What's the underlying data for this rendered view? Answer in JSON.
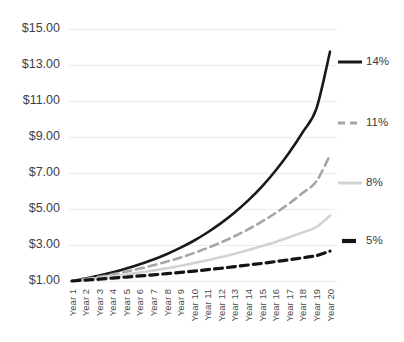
{
  "chart_data": {
    "type": "line",
    "title": "",
    "subtitle": "",
    "xlabel": "",
    "ylabel": "",
    "grid": true,
    "legend_position": "right-inline-end-of-line",
    "x": [
      "Year 1",
      "Year 2",
      "Year 3",
      "Year 4",
      "Year 5",
      "Year 6",
      "Year 7",
      "Year 8",
      "Year 9",
      "Year 10",
      "Year 11",
      "Year 12",
      "Year 13",
      "Year 14",
      "Year 15",
      "Year 16",
      "Year 17",
      "Year 18",
      "Year 19",
      "Year 20"
    ],
    "categories": [
      "Year 1",
      "Year 2",
      "Year 3",
      "Year 4",
      "Year 5",
      "Year 6",
      "Year 7",
      "Year 8",
      "Year 9",
      "Year 10",
      "Year 11",
      "Year 12",
      "Year 13",
      "Year 14",
      "Year 15",
      "Year 16",
      "Year 17",
      "Year 18",
      "Year 19",
      "Year 20"
    ],
    "ylim": [
      1.0,
      15.0
    ],
    "ytick_values": [
      1.0,
      3.0,
      5.0,
      7.0,
      9.0,
      11.0,
      13.0,
      15.0
    ],
    "ytick_labels": [
      "$1.00",
      "$3.00",
      "$5.00",
      "$7.00",
      "$9.00",
      "$11.00",
      "$13.00",
      "$15.00"
    ],
    "series": [
      {
        "name": "14%",
        "label": "14%",
        "color": "#1a1a1a",
        "style": "solid",
        "values": [
          1.0,
          1.14,
          1.3,
          1.48,
          1.69,
          1.93,
          2.19,
          2.5,
          2.85,
          3.25,
          3.71,
          4.23,
          4.82,
          5.49,
          6.26,
          7.14,
          8.14,
          9.28,
          10.58,
          13.74
        ]
      },
      {
        "name": "11%",
        "label": "11%",
        "color": "#a6a6a6",
        "style": "dashed",
        "values": [
          1.0,
          1.11,
          1.23,
          1.37,
          1.52,
          1.69,
          1.87,
          2.08,
          2.3,
          2.56,
          2.84,
          3.15,
          3.5,
          3.88,
          4.31,
          4.78,
          5.31,
          5.9,
          6.54,
          8.0
        ]
      },
      {
        "name": "8%",
        "label": "8%",
        "color": "#d2d2d2",
        "style": "solid",
        "values": [
          1.0,
          1.08,
          1.17,
          1.26,
          1.36,
          1.47,
          1.59,
          1.71,
          1.85,
          2.0,
          2.16,
          2.33,
          2.52,
          2.72,
          2.94,
          3.17,
          3.43,
          3.7,
          4.0,
          4.63
        ]
      },
      {
        "name": "5%",
        "label": "5%",
        "color": "#141414",
        "style": "dashed-thick",
        "values": [
          1.0,
          1.05,
          1.1,
          1.16,
          1.22,
          1.28,
          1.34,
          1.41,
          1.48,
          1.55,
          1.63,
          1.71,
          1.8,
          1.89,
          1.98,
          2.08,
          2.18,
          2.29,
          2.41,
          2.66
        ]
      }
    ]
  },
  "colors": {
    "background": "#ffffff",
    "gridline": "#ececec",
    "tick_text": "#3f3f3f",
    "series_14": "#1a1a1a",
    "series_11": "#a6a6a6",
    "series_8": "#d2d2d2",
    "series_5": "#141414"
  }
}
